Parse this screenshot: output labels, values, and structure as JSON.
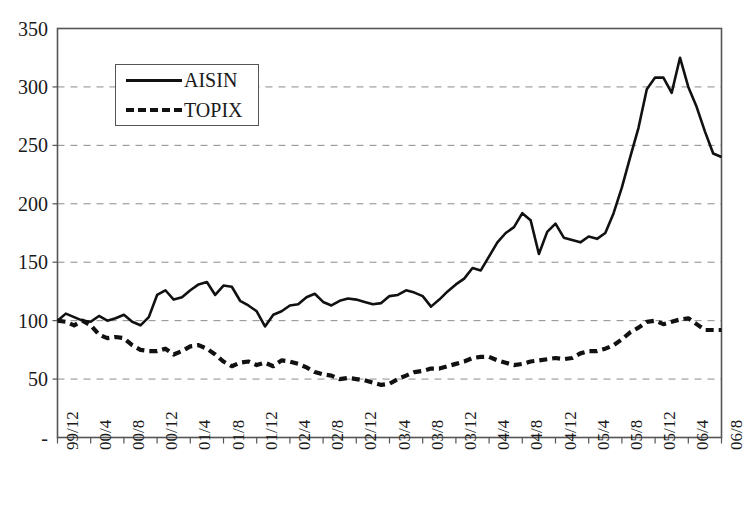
{
  "chart_data": {
    "type": "line",
    "title": "",
    "xlabel": "",
    "ylabel": "",
    "ylim": [
      0,
      350
    ],
    "yticks": [
      "-",
      "50",
      "100",
      "150",
      "200",
      "250",
      "300",
      "350"
    ],
    "ytick_values": [
      0,
      50,
      100,
      150,
      200,
      250,
      300,
      350
    ],
    "grid": "horizontal-dashed",
    "legend_position": "top-left-inside",
    "categories": [
      "99/12",
      "00/1",
      "00/2",
      "00/3",
      "00/4",
      "00/5",
      "00/6",
      "00/7",
      "00/8",
      "00/9",
      "00/10",
      "00/11",
      "00/12",
      "01/1",
      "01/2",
      "01/3",
      "01/4",
      "01/5",
      "01/6",
      "01/7",
      "01/8",
      "01/9",
      "01/10",
      "01/11",
      "01/12",
      "02/1",
      "02/2",
      "02/3",
      "02/4",
      "02/5",
      "02/6",
      "02/7",
      "02/8",
      "02/9",
      "02/10",
      "02/11",
      "02/12",
      "03/1",
      "03/2",
      "03/3",
      "03/4",
      "03/5",
      "03/6",
      "03/7",
      "03/8",
      "03/9",
      "03/10",
      "03/11",
      "03/12",
      "04/1",
      "04/2",
      "04/3",
      "04/4",
      "04/5",
      "04/6",
      "04/7",
      "04/8",
      "04/9",
      "04/10",
      "04/11",
      "04/12",
      "05/1",
      "05/2",
      "05/3",
      "05/4",
      "05/5",
      "05/6",
      "05/7",
      "05/8",
      "05/9",
      "05/10",
      "05/11",
      "05/12",
      "06/1",
      "06/2",
      "06/3",
      "06/4",
      "06/5",
      "06/6",
      "06/7",
      "06/8"
    ],
    "xtick_labels": [
      "99/12",
      "00/4",
      "00/8",
      "00/12",
      "01/4",
      "01/8",
      "01/12",
      "02/4",
      "02/8",
      "02/12",
      "03/4",
      "03/8",
      "03/12",
      "04/4",
      "04/8",
      "04/12",
      "05/4",
      "05/8",
      "05/12",
      "06/4",
      "06/8"
    ],
    "series": [
      {
        "name": "AISIN",
        "style": "solid",
        "color": "#111111",
        "values": [
          100,
          106,
          103,
          100,
          99,
          104,
          100,
          102,
          105,
          99,
          96,
          103,
          122,
          126,
          118,
          120,
          126,
          131,
          133,
          122,
          130,
          129,
          117,
          113,
          108,
          95,
          105,
          108,
          113,
          114,
          120,
          123,
          116,
          113,
          117,
          119,
          118,
          116,
          114,
          115,
          121,
          122,
          126,
          124,
          121,
          112,
          118,
          125,
          131,
          136,
          145,
          143,
          155,
          167,
          175,
          180,
          192,
          186,
          157,
          176,
          183,
          171,
          169,
          167,
          172,
          170,
          175,
          192,
          214,
          240,
          265,
          298,
          308,
          308,
          295,
          325,
          300,
          283,
          262,
          243,
          240
        ]
      },
      {
        "name": "TOPIX",
        "style": "dashed",
        "color": "#111111",
        "values": [
          100,
          99,
          96,
          100,
          96,
          88,
          85,
          86,
          85,
          79,
          75,
          74,
          74,
          76,
          71,
          74,
          78,
          79,
          76,
          71,
          65,
          61,
          64,
          65,
          62,
          64,
          61,
          66,
          65,
          63,
          60,
          56,
          54,
          53,
          50,
          51,
          50,
          49,
          47,
          45,
          46,
          50,
          53,
          56,
          57,
          59,
          59,
          61,
          63,
          65,
          68,
          69,
          69,
          66,
          64,
          62,
          63,
          65,
          66,
          67,
          68,
          67,
          68,
          72,
          74,
          74,
          76,
          79,
          84,
          90,
          94,
          99,
          100,
          97,
          99,
          101,
          102,
          97,
          92,
          92,
          92
        ]
      }
    ]
  },
  "legend": {
    "items": [
      {
        "label": "AISIN",
        "style": "solid"
      },
      {
        "label": "TOPIX",
        "style": "dashed"
      }
    ]
  },
  "colors": {
    "line": "#111111",
    "grid": "#8c8c8c",
    "axis": "#555555",
    "text": "#1a1a1a",
    "background": "#ffffff"
  }
}
